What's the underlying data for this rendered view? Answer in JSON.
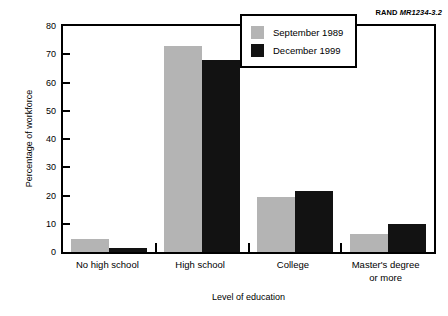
{
  "report_id": {
    "org": "RAND",
    "number": "MR1234-3.2"
  },
  "chart_data": {
    "type": "bar",
    "title": "",
    "xlabel": "Level of education",
    "ylabel": "Percentage of workforce",
    "categories": [
      "No high school",
      "High school",
      "College",
      "Master's degree or more"
    ],
    "category_lines": [
      [
        "No high school"
      ],
      [
        "High school"
      ],
      [
        "College"
      ],
      [
        "Master's degree",
        "or more"
      ]
    ],
    "series": [
      {
        "name": "September 1989",
        "color": "#b4b4b4",
        "values": [
          4.5,
          73,
          19.5,
          6.5
        ]
      },
      {
        "name": "December 1999",
        "color": "#121212",
        "values": [
          1.5,
          68,
          21.5,
          10
        ]
      }
    ],
    "ylim": [
      0,
      80
    ],
    "yticks": [
      0,
      10,
      20,
      30,
      40,
      50,
      60,
      70,
      80
    ],
    "ytick_labels": [
      "0",
      "10",
      "20",
      "30",
      "40",
      "50",
      "60",
      "70",
      "80"
    ],
    "grid": false,
    "legend_position": "top-right"
  }
}
